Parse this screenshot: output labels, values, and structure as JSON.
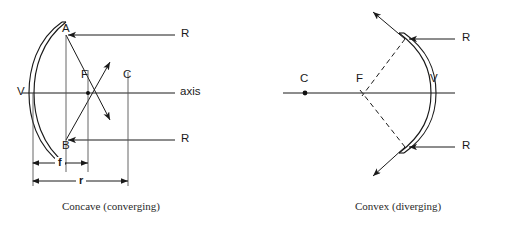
{
  "figure": {
    "background_color": "#ffffff",
    "line_color": "#1a1a1a",
    "guide_color": "#555555"
  },
  "panels": [
    {
      "id": "concave",
      "caption": "Concave (converging)",
      "labels": {
        "vertex": "V",
        "focus": "F",
        "center": "C",
        "axis": "axis",
        "top_point": "A",
        "bottom_point": "B",
        "ray_top": "R",
        "ray_bottom": "R",
        "focal_length": "f",
        "radius": "r"
      }
    },
    {
      "id": "convex",
      "caption": "Convex (diverging)",
      "labels": {
        "vertex": "V",
        "focus": "F",
        "center": "C",
        "ray_top": "R",
        "ray_bottom": "R"
      }
    }
  ]
}
